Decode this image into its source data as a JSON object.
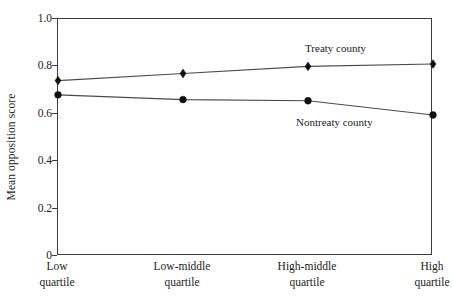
{
  "chart_data": {
    "type": "line",
    "title": "",
    "xlabel": "",
    "ylabel": "Mean opposition score",
    "categories": [
      "Low quartile",
      "Low-middle quartile",
      "High-middle quartile",
      "High quartile"
    ],
    "category_lines": [
      [
        "Low",
        "quartile"
      ],
      [
        "Low-middle",
        "quartile"
      ],
      [
        "High-middle",
        "quartile"
      ],
      [
        "High",
        "quartile"
      ]
    ],
    "ylim": [
      0,
      1.0
    ],
    "yticks": [
      "0",
      "0.2",
      "0.4",
      "0.6",
      "0.8",
      "1.0"
    ],
    "ytick_values": [
      0,
      0.2,
      0.4,
      0.6,
      0.8,
      1.0
    ],
    "grid": false,
    "legend_position": "inline-annotation",
    "series": [
      {
        "name": "Treaty county",
        "marker": "diamond",
        "color": "#111111",
        "values": [
          0.74,
          0.77,
          0.8,
          0.81
        ],
        "annotation": {
          "text": "Treaty county",
          "x_px": 305,
          "y_px": 42
        }
      },
      {
        "name": "Nontreaty county",
        "marker": "circle",
        "color": "#111111",
        "values": [
          0.68,
          0.66,
          0.655,
          0.595
        ],
        "annotation": {
          "text": "Nontreaty county",
          "x_px": 296,
          "y_px": 116
        }
      }
    ]
  },
  "axis": {
    "y_title": "Mean opposition score",
    "y_ticks": [
      "1.0",
      "0.8",
      "0.6",
      "0.4",
      "0.2",
      "0"
    ],
    "x_labels_line1": [
      "Low",
      "Low-middle",
      "High-middle",
      "High"
    ],
    "x_labels_line2": [
      "quartile",
      "quartile",
      "quartile",
      "quartile"
    ]
  },
  "annotations": {
    "treaty": "Treaty county",
    "nontreaty": "Nontreaty county"
  },
  "colors": {
    "axis": "#3b3b3b",
    "line": "#4a4a4a",
    "marker": "#111111",
    "text": "#1a1a1a",
    "background": "#ffffff"
  }
}
